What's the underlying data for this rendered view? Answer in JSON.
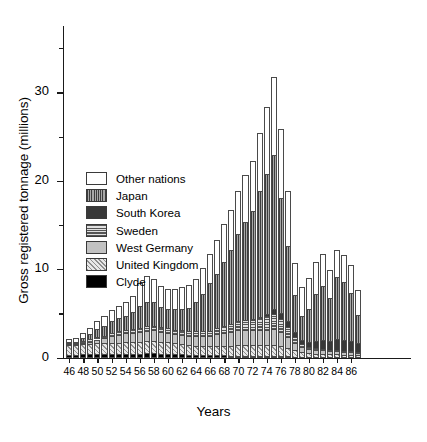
{
  "chart_data": {
    "type": "bar",
    "stacked": true,
    "title": "",
    "xlabel": "Years",
    "ylabel": "Gross registered tonnage (millions)",
    "ylim": [
      0,
      37.5
    ],
    "yticks_major": [
      0,
      10,
      20,
      30
    ],
    "yticks_minor": [
      5,
      15,
      25,
      35
    ],
    "grid": false,
    "legend_position": "inside-left",
    "categories": [
      "46",
      "47",
      "48",
      "49",
      "50",
      "51",
      "52",
      "53",
      "54",
      "55",
      "56",
      "57",
      "58",
      "59",
      "60",
      "61",
      "62",
      "63",
      "64",
      "65",
      "66",
      "67",
      "68",
      "69",
      "70",
      "71",
      "72",
      "73",
      "74",
      "75",
      "76",
      "77",
      "78",
      "79",
      "80",
      "81",
      "82",
      "83",
      "84",
      "85",
      "86",
      "87"
    ],
    "xtick_labels": [
      "46",
      "48",
      "50",
      "52",
      "54",
      "56",
      "58",
      "60",
      "62",
      "64",
      "66",
      "68",
      "70",
      "72",
      "74",
      "76",
      "78",
      "80",
      "82",
      "84",
      "86"
    ],
    "series": [
      {
        "name": "Clyde",
        "fill": "f-clyde",
        "color": "#000000",
        "values": [
          0.35,
          0.35,
          0.4,
          0.42,
          0.45,
          0.45,
          0.45,
          0.45,
          0.45,
          0.45,
          0.45,
          0.48,
          0.48,
          0.45,
          0.42,
          0.4,
          0.38,
          0.35,
          0.32,
          0.3,
          0.28,
          0.26,
          0.26,
          0.24,
          0.22,
          0.22,
          0.2,
          0.2,
          0.18,
          0.18,
          0.16,
          0.14,
          0.12,
          0.1,
          0.08,
          0.08,
          0.08,
          0.07,
          0.07,
          0.06,
          0.06,
          0.05
        ]
      },
      {
        "name": "United Kingdom",
        "fill": "f-uk",
        "color": "#9a9a9a",
        "values": [
          1.1,
          1.05,
          1.1,
          1.15,
          1.2,
          1.18,
          1.25,
          1.25,
          1.3,
          1.3,
          1.35,
          1.4,
          1.4,
          1.35,
          1.3,
          1.2,
          1.15,
          1.1,
          1.05,
          1.05,
          1.05,
          1.1,
          1.05,
          1.05,
          1.2,
          1.2,
          1.2,
          1.2,
          1.2,
          1.2,
          1.1,
          0.95,
          0.7,
          0.5,
          0.4,
          0.35,
          0.35,
          0.3,
          0.3,
          0.25,
          0.25,
          0.2
        ]
      },
      {
        "name": "West Germany",
        "fill": "f-wgermany",
        "color": "#c2c2c2",
        "values": [
          0.1,
          0.1,
          0.15,
          0.25,
          0.4,
          0.55,
          0.75,
          0.9,
          1.0,
          1.05,
          1.1,
          1.15,
          1.2,
          1.15,
          1.1,
          1.05,
          1.05,
          1.05,
          1.05,
          1.05,
          1.1,
          1.3,
          1.45,
          1.6,
          1.7,
          1.7,
          1.7,
          1.75,
          1.8,
          1.85,
          1.6,
          1.2,
          0.8,
          0.55,
          0.5,
          0.45,
          0.45,
          0.4,
          0.4,
          0.35,
          0.35,
          0.3
        ]
      },
      {
        "name": "Sweden",
        "fill": "f-sweden",
        "color": "#8f8f8f",
        "values": [
          0.15,
          0.15,
          0.2,
          0.25,
          0.3,
          0.32,
          0.35,
          0.38,
          0.4,
          0.42,
          0.45,
          0.5,
          0.5,
          0.48,
          0.48,
          0.5,
          0.5,
          0.52,
          0.55,
          0.6,
          0.62,
          0.7,
          0.8,
          0.95,
          1.05,
          1.1,
          1.2,
          1.35,
          1.55,
          1.7,
          1.55,
          1.2,
          0.7,
          0.35,
          0.22,
          0.18,
          0.15,
          0.12,
          0.1,
          0.08,
          0.06,
          0.05
        ]
      },
      {
        "name": "South Korea",
        "fill": "f-korea",
        "color": "#383838",
        "values": [
          0,
          0,
          0,
          0,
          0,
          0,
          0,
          0,
          0,
          0,
          0,
          0,
          0,
          0,
          0,
          0,
          0,
          0,
          0,
          0,
          0,
          0,
          0,
          0,
          0,
          0,
          0.05,
          0.1,
          0.25,
          0.55,
          0.6,
          0.6,
          0.55,
          0.45,
          0.55,
          0.8,
          1.0,
          1.0,
          1.2,
          1.2,
          1.2,
          1.0
        ]
      },
      {
        "name": "Japan",
        "fill": "f-japan",
        "color": "#4d4d4d",
        "values": [
          0.1,
          0.15,
          0.35,
          0.6,
          0.85,
          1.1,
          1.35,
          1.5,
          1.55,
          1.9,
          2.5,
          2.8,
          2.7,
          2.3,
          2.2,
          2.35,
          2.4,
          2.6,
          3.3,
          4.2,
          5.35,
          6.1,
          7.2,
          8.3,
          9.8,
          11.1,
          12.2,
          14.2,
          15.8,
          17.4,
          13.0,
          8.5,
          4.2,
          2.8,
          3.8,
          5.3,
          6.1,
          4.8,
          7.0,
          6.6,
          5.4,
          3.2
        ]
      },
      {
        "name": "Other nations",
        "fill": "f-other",
        "color": "#ffffff",
        "values": [
          0.35,
          0.45,
          0.6,
          0.7,
          0.95,
          1.1,
          1.2,
          1.4,
          1.6,
          1.85,
          2.6,
          2.85,
          2.6,
          2.4,
          2.3,
          2.3,
          2.55,
          2.55,
          2.65,
          2.95,
          3.35,
          3.8,
          4.3,
          4.6,
          4.9,
          5.3,
          5.7,
          6.65,
          7.6,
          8.8,
          7.8,
          6.3,
          3.6,
          3.2,
          3.5,
          3.7,
          3.6,
          3.2,
          3.1,
          3.1,
          3.1,
          2.9
        ]
      }
    ],
    "legend": [
      {
        "label": "Other nations",
        "fill": "f-other"
      },
      {
        "label": "Japan",
        "fill": "f-japan"
      },
      {
        "label": "South Korea",
        "fill": "f-korea"
      },
      {
        "label": "Sweden",
        "fill": "f-sweden"
      },
      {
        "label": "West Germany",
        "fill": "f-wgermany"
      },
      {
        "label": "United Kingdom",
        "fill": "f-uk"
      },
      {
        "label": "Clyde",
        "fill": "f-clyde"
      }
    ]
  }
}
